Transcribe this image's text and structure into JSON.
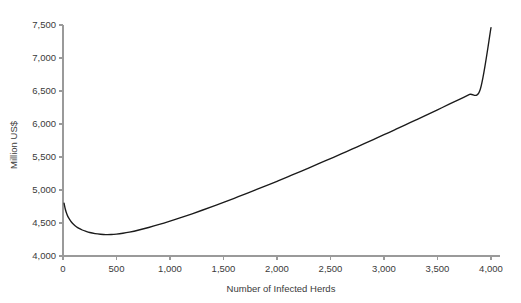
{
  "chart_data": {
    "type": "line",
    "title": "",
    "subtitle": "",
    "xlabel": "Number of Infected Herds",
    "ylabel": "Million US$",
    "xlim": [
      0,
      4000
    ],
    "ylim": [
      4000,
      7500
    ],
    "grid": false,
    "legend": false,
    "legend_position": "none",
    "xticks": [
      0,
      500,
      1000,
      1500,
      2000,
      2500,
      3000,
      3500,
      4000
    ],
    "xticklabels": [
      "0",
      "500",
      "1,000",
      "1,500",
      "2,000",
      "2,500",
      "3,000",
      "3,500",
      "4,000"
    ],
    "yticks": [
      4000,
      4500,
      5000,
      5500,
      6000,
      6500,
      7000,
      7500
    ],
    "yticklabels": [
      "4,000",
      "4,500",
      "5,000",
      "5,500",
      "6,000",
      "6,500",
      "7,000",
      "7,500"
    ],
    "series": [
      {
        "name": "Total cost",
        "color": "#1b1b1b",
        "x": [
          10,
          20,
          30,
          45,
          60,
          80,
          100,
          125,
          150,
          180,
          210,
          250,
          300,
          350,
          400,
          450,
          500,
          560,
          620,
          700,
          800,
          900,
          1000,
          1100,
          1200,
          1300,
          1400,
          1500,
          1600,
          1700,
          1800,
          1900,
          2000,
          2100,
          2200,
          2300,
          2400,
          2500,
          2600,
          2700,
          2800,
          2900,
          3000,
          3100,
          3200,
          3300,
          3400,
          3500,
          3600,
          3700,
          3800,
          3900,
          4000
        ],
        "y": [
          4800,
          4720,
          4664,
          4600,
          4558,
          4512,
          4478,
          4444,
          4418,
          4394,
          4376,
          4356,
          4340,
          4330,
          4325,
          4326,
          4332,
          4345,
          4362,
          4390,
          4432,
          4478,
          4528,
          4581,
          4636,
          4693,
          4752,
          4812,
          4874,
          4937,
          5001,
          5066,
          5132,
          5199,
          5267,
          5336,
          5406,
          5476,
          5547,
          5619,
          5691,
          5764,
          5838,
          5912,
          5987,
          6062,
          6138,
          6215,
          6292,
          6370,
          6448,
          6527,
          7460
        ]
      }
    ],
    "annotations": {
      "curve_minimum_value": 4325,
      "curve_minimum_x": 400,
      "curve_start_value": 4800,
      "curve_end_value": 7460
    }
  },
  "axes": {
    "y_axis_name": "million-us-dollars-axis",
    "x_axis_name": "number-of-infected-herds-axis"
  }
}
